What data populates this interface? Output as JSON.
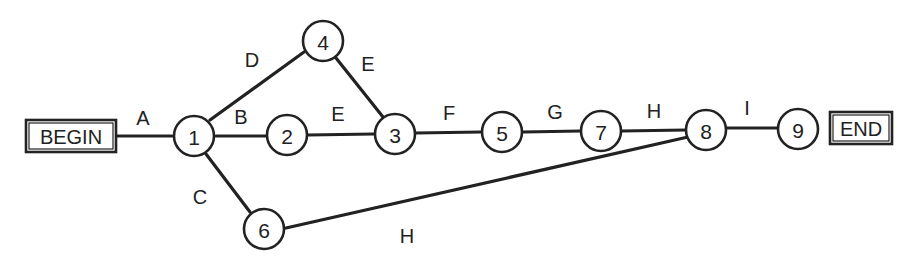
{
  "diagram": {
    "type": "activity-on-arrow network",
    "terminals": {
      "begin": {
        "label": "BEGIN"
      },
      "end": {
        "label": "END"
      }
    },
    "nodes": [
      {
        "id": "1",
        "label": "1"
      },
      {
        "id": "2",
        "label": "2"
      },
      {
        "id": "3",
        "label": "3"
      },
      {
        "id": "4",
        "label": "4"
      },
      {
        "id": "5",
        "label": "5"
      },
      {
        "id": "6",
        "label": "6"
      },
      {
        "id": "7",
        "label": "7"
      },
      {
        "id": "8",
        "label": "8"
      },
      {
        "id": "9",
        "label": "9"
      }
    ],
    "edges": [
      {
        "from": "BEGIN",
        "to": "1",
        "label": "A"
      },
      {
        "from": "1",
        "to": "2",
        "label": "B"
      },
      {
        "from": "1",
        "to": "6",
        "label": "C"
      },
      {
        "from": "1",
        "to": "4",
        "label": "D"
      },
      {
        "from": "4",
        "to": "3",
        "label": "E"
      },
      {
        "from": "2",
        "to": "3",
        "label": "E"
      },
      {
        "from": "3",
        "to": "5",
        "label": "F"
      },
      {
        "from": "5",
        "to": "7",
        "label": "G"
      },
      {
        "from": "7",
        "to": "8",
        "label": "H"
      },
      {
        "from": "6",
        "to": "8",
        "label": "H"
      },
      {
        "from": "8",
        "to": "9",
        "label": "I"
      },
      {
        "from": "9",
        "to": "END",
        "label": ""
      }
    ]
  }
}
